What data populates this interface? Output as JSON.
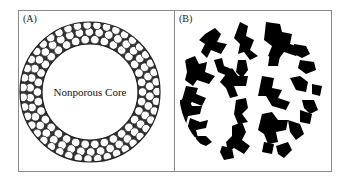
{
  "figure": {
    "panels": [
      {
        "id": "A",
        "label": "(A)",
        "core_label": "Nonporous Core",
        "description": "Core-shell particle: nonporous core surrounded by a shell of packed small spheres"
      },
      {
        "id": "B",
        "label": "(B)",
        "description": "Fully porous particle cross-section with irregular branching black pore structure"
      }
    ],
    "colors": {
      "frame": "#8a8a8a",
      "ink": "#111111",
      "background": "#ffffff"
    }
  }
}
